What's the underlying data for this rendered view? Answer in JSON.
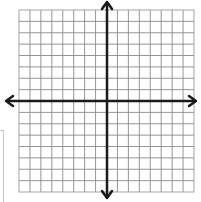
{
  "diagram": {
    "type": "coordinate-plane",
    "grid": {
      "columns": 16,
      "rows": 16,
      "left": 19,
      "top": 10,
      "right": 194,
      "bottom": 192,
      "line_color": "#8a8a8a",
      "border_color": "#9a9a9a"
    },
    "axes": {
      "origin_x": 107,
      "origin_y": 101,
      "color": "#1a1a1a",
      "stroke_width": 2.5,
      "x_axis": {
        "from": 6,
        "to": 196,
        "arrows": [
          "left",
          "right"
        ]
      },
      "y_axis": {
        "from": 2,
        "to": 198,
        "arrows": [
          "up",
          "down"
        ]
      }
    },
    "labels": []
  }
}
